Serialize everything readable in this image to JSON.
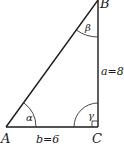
{
  "diagram": {
    "type": "right-triangle",
    "vertices": {
      "A": {
        "label": "A"
      },
      "B": {
        "label": "B"
      },
      "C": {
        "label": "C"
      }
    },
    "angles": {
      "alpha": {
        "label": "α",
        "at": "A"
      },
      "beta": {
        "label": "β",
        "at": "B"
      },
      "gamma": {
        "label": "γ",
        "at": "C",
        "right_angle": true
      }
    },
    "sides": {
      "a": {
        "label": "a=8",
        "between": "B-C"
      },
      "b": {
        "label": "b=6",
        "between": "A-C"
      }
    },
    "colors": {
      "stroke": "#1a1a1a",
      "background": "#ffffff"
    }
  }
}
